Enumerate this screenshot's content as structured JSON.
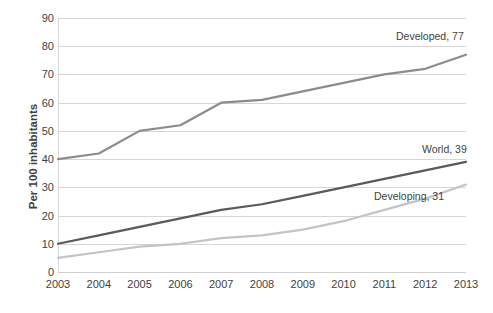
{
  "chart_data": {
    "type": "line",
    "title": "",
    "xlabel": "",
    "ylabel": "Per 100 inhabitants",
    "x": [
      2003,
      2004,
      2005,
      2006,
      2007,
      2008,
      2009,
      2010,
      2011,
      2012,
      2013
    ],
    "categories": [
      "2003",
      "2004",
      "2005",
      "2006",
      "2007",
      "2008",
      "2009",
      "2010",
      "2011",
      "2012",
      "2013"
    ],
    "ylim": [
      0,
      90
    ],
    "ytick_labels": [
      "0",
      "10",
      "20",
      "30",
      "40",
      "50",
      "60",
      "70",
      "80",
      "90"
    ],
    "yticks": [
      0,
      10,
      20,
      30,
      40,
      50,
      60,
      70,
      80,
      90
    ],
    "grid": true,
    "legend_position": "end-of-line-labels",
    "series": [
      {
        "name": "Developed",
        "values": [
          40,
          42,
          50,
          52,
          60,
          61,
          64,
          67,
          70,
          72,
          77
        ],
        "color": "#8c8c8c",
        "end_label": "Developed, 77",
        "end_value": 77
      },
      {
        "name": "World",
        "values": [
          10,
          13,
          16,
          19,
          22,
          24,
          27,
          30,
          33,
          36,
          39
        ],
        "color": "#5a5a5a",
        "end_label": "World, 39",
        "end_value": 39
      },
      {
        "name": "Developing",
        "values": [
          5,
          7,
          9,
          10,
          12,
          13,
          15,
          18,
          22,
          26,
          31
        ],
        "color": "#c4c4c4",
        "end_label": "Developing, 31",
        "end_value": 31
      }
    ],
    "annotations": [
      {
        "text": "Developed, 77",
        "series": "Developed"
      },
      {
        "text": "World, 39",
        "series": "World"
      },
      {
        "text": "Developing, 31",
        "series": "Developing"
      }
    ],
    "colors": {
      "developed": "#8c8c8c",
      "world": "#5a5a5a",
      "developing": "#c4c4c4",
      "gridline": "#d6d6d6",
      "text": "#3f3f3f",
      "background": "#ffffff"
    }
  }
}
